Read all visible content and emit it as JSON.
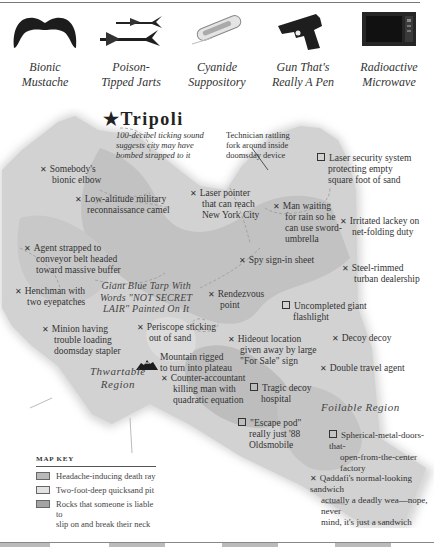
{
  "gadgets": [
    {
      "icon": "mustache-icon",
      "line1": "Bionic",
      "line2": "Mustache"
    },
    {
      "icon": "darts-icon",
      "line1": "Poison-",
      "line2": "Tipped Jarts"
    },
    {
      "icon": "suppository-icon",
      "line1": "Cyanide",
      "line2": "Suppository"
    },
    {
      "icon": "gun-icon",
      "line1": "Gun That's",
      "line2": "Really A Pen"
    },
    {
      "icon": "microwave-icon",
      "line1": "Radioactive",
      "line2": "Microwave"
    }
  ],
  "map": {
    "city": {
      "name": "★Tripoli",
      "note": [
        "100-decibel ticking sound",
        "suggests city may have",
        "bombed strapped to it"
      ]
    },
    "regions": {
      "thwartable": [
        "Thwartable",
        "Region"
      ],
      "foilable": [
        "Foilable Region"
      ],
      "tarp": [
        "Giant Blue Tarp With",
        "Words \"NOT SECRET",
        "LAIR\" Painted On It"
      ]
    },
    "technician": [
      "Technician rattling",
      "fork around inside",
      "doomsday device"
    ],
    "mountain": [
      "Mountain rigged",
      "to turn into plateau"
    ],
    "x_marker": "✕",
    "labels": [
      {
        "id": "elbow",
        "type": "x",
        "lines": [
          "Somebody's",
          "bionic elbow"
        ]
      },
      {
        "id": "camel",
        "type": "x",
        "lines": [
          "Low-altitude military",
          "reconnaissance camel"
        ]
      },
      {
        "id": "laser",
        "type": "x",
        "lines": [
          "Laser pointer",
          "that can reach",
          "New York City"
        ]
      },
      {
        "id": "rain",
        "type": "x",
        "lines": [
          "Man waiting",
          "for rain so he",
          "can use sword-",
          "umbrella"
        ]
      },
      {
        "id": "security",
        "type": "sq",
        "lines": [
          "Laser security system",
          "protecting empty",
          "square foot of sand"
        ]
      },
      {
        "id": "lackey",
        "type": "x",
        "lines": [
          "Irritated lackey on",
          "net-folding duty"
        ]
      },
      {
        "id": "agent",
        "type": "x",
        "lines": [
          "Agent strapped to",
          "conveyor belt headed",
          "toward massive buffer"
        ]
      },
      {
        "id": "spy",
        "type": "x",
        "lines": [
          "Spy sign-in sheet"
        ]
      },
      {
        "id": "turban",
        "type": "x",
        "lines": [
          "Steel-rimmed",
          "turban dealership"
        ]
      },
      {
        "id": "henchman",
        "type": "x",
        "lines": [
          "Henchman with",
          "two eyepatches"
        ]
      },
      {
        "id": "rendezvous",
        "type": "x",
        "lines": [
          "Rendezvous",
          "point"
        ]
      },
      {
        "id": "flashlight",
        "type": "sq",
        "lines": [
          "Uncompleted giant",
          "flashlight"
        ]
      },
      {
        "id": "minion",
        "type": "x",
        "lines": [
          "Minion having",
          "trouble loading",
          "doomsday stapler"
        ]
      },
      {
        "id": "periscope",
        "type": "x",
        "lines": [
          "Periscope sticking",
          "out of sand"
        ]
      },
      {
        "id": "hideout",
        "type": "x",
        "lines": [
          "Hideout location",
          "given away by large",
          "\"For Sale\" sign"
        ]
      },
      {
        "id": "decoy",
        "type": "x",
        "lines": [
          "Decoy decoy"
        ]
      },
      {
        "id": "counter",
        "type": "x",
        "lines": [
          "Counter-accountant",
          "killing man with",
          "quadratic equation"
        ]
      },
      {
        "id": "hospital",
        "type": "sq",
        "lines": [
          "Tragic decoy",
          "hospital"
        ]
      },
      {
        "id": "travel",
        "type": "x",
        "lines": [
          "Double travel agent"
        ]
      },
      {
        "id": "escape",
        "type": "sq",
        "lines": [
          "\"Escape pod\"",
          "really just '88",
          "Oldsmobile"
        ]
      },
      {
        "id": "factory",
        "type": "sq",
        "lines": [
          "Spherical-metal-doors-that-",
          "open-from-the-center factory"
        ]
      },
      {
        "id": "sandwich",
        "type": "x",
        "lines": [
          "Qaddafi's normal-looking sandwich",
          "actually a deadly wea—nope, never",
          "mind, it's just a sandwich"
        ]
      }
    ]
  },
  "map_key": {
    "title": "MAP KEY",
    "items": [
      {
        "label": [
          "Headache-inducing death ray"
        ],
        "color": "#b9b9b9"
      },
      {
        "label": [
          "Two-foot-deep quicksand pit"
        ],
        "color": "#e2e2e2"
      },
      {
        "label": [
          "Rocks that someone is liable to",
          "slip on and break their neck"
        ],
        "color": "#a4a4a4"
      }
    ]
  },
  "colors": {
    "land_light": "#d8d8d8",
    "land_mid": "#c6c6c6",
    "land_dark": "#b3b3b3",
    "ink": "#2a2a2a"
  }
}
